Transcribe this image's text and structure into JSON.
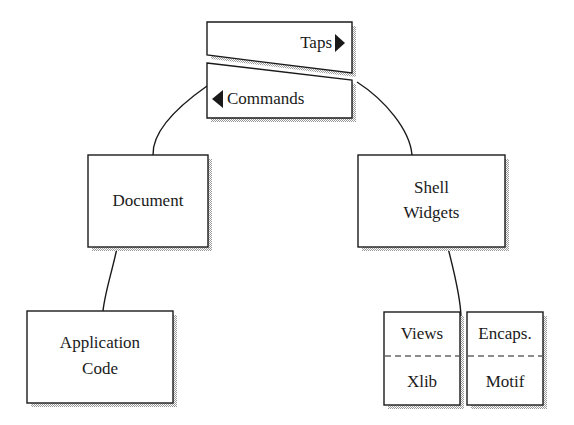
{
  "diagram": {
    "top_node": {
      "taps_label": "Taps",
      "taps_arrow": "right-triangle-icon",
      "commands_label": "Commands",
      "commands_arrow": "left-triangle-icon"
    },
    "nodes": {
      "document": {
        "label": "Document"
      },
      "shell_widgets": {
        "line1": "Shell",
        "line2": "Widgets"
      },
      "application_code": {
        "line1": "Application",
        "line2": "Code"
      },
      "views_xlib": {
        "top": "Views",
        "bottom": "Xlib"
      },
      "encaps_motif": {
        "top": "Encaps.",
        "bottom": "Motif"
      }
    },
    "edges": [
      {
        "from": "commands",
        "to": "document"
      },
      {
        "from": "commands",
        "to": "shell_widgets"
      },
      {
        "from": "document",
        "to": "application_code"
      },
      {
        "from": "shell_widgets",
        "to": "views_xlib"
      }
    ],
    "colors": {
      "stroke": "#1a1a1a",
      "shadow": "#b8b8b8",
      "fill": "#ffffff"
    }
  }
}
